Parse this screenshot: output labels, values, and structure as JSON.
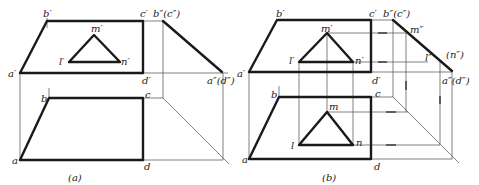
{
  "figures": [
    {
      "id": "a",
      "caption": "(a)",
      "labels": {
        "b_prime": "b′",
        "c_prime": "c′",
        "b_dprime_c_dprime": "b″(c″)",
        "m_prime": "m′",
        "l_prime": "l′",
        "n_prime": "n′",
        "a_prime": "a′",
        "d_prime": "d′",
        "a_dprime_d_dprime": "a″(d″)",
        "b": "b",
        "c": "c",
        "a": "a",
        "d": "d"
      }
    },
    {
      "id": "b",
      "caption": "(b)",
      "labels": {
        "b_prime": "b′",
        "c_prime": "c′",
        "b_dprime_c_dprime": "b″(c″)",
        "m_prime": "m′",
        "m_dprime": "m″",
        "l_prime": "l′",
        "n_prime": "n′",
        "l_dprime": "l″",
        "n_dprime": "(n″)",
        "a_prime": "a′",
        "d_prime": "d′",
        "a_dprime_d_dprime": "a″(d″)",
        "b": "b",
        "c": "c",
        "m": "m",
        "l": "l",
        "n": "n",
        "a": "a",
        "d": "d"
      }
    }
  ],
  "colors": {
    "ink": "#1a1a1a",
    "construction": "#4a4a4a",
    "background": "#ffffff"
  }
}
